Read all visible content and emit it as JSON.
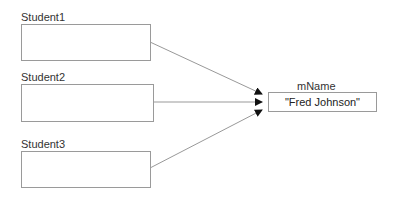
{
  "references": [
    {
      "label": "Student1"
    },
    {
      "label": "Student2"
    },
    {
      "label": "Student3"
    }
  ],
  "target": {
    "label": "mName",
    "value": "\"Fred Johnson\""
  }
}
